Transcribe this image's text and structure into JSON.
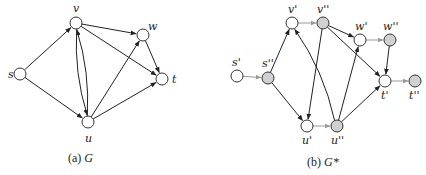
{
  "colors": {
    "edge": "#222222",
    "split_edge": "#999999",
    "node_stroke": "#333333",
    "node_fill_in": "#ffffff",
    "node_fill_out": "#d0d0d0"
  },
  "graph_a": {
    "caption_prefix": "(a) ",
    "caption_symbol": "G",
    "nodes": [
      {
        "id": "s",
        "label": "s",
        "x": 20,
        "y": 74,
        "lx": 8,
        "ly": 78
      },
      {
        "id": "v",
        "label": "v",
        "x": 76,
        "y": 23,
        "lx": 73,
        "ly": 12
      },
      {
        "id": "w",
        "label": "w",
        "x": 143,
        "y": 35,
        "lx": 148,
        "ly": 30
      },
      {
        "id": "t",
        "label": "t",
        "x": 162,
        "y": 79,
        "lx": 172,
        "ly": 83
      },
      {
        "id": "u",
        "label": "u",
        "x": 88,
        "y": 122,
        "lx": 85,
        "ly": 142
      }
    ],
    "edges": [
      [
        "s",
        "v"
      ],
      [
        "s",
        "u"
      ],
      [
        "v",
        "w"
      ],
      [
        "v",
        "t"
      ],
      [
        "v",
        "u"
      ],
      [
        "u",
        "v"
      ],
      [
        "u",
        "w"
      ],
      [
        "u",
        "t"
      ],
      [
        "w",
        "t"
      ]
    ]
  },
  "graph_b": {
    "caption_prefix": "(b) ",
    "caption_symbol": "G*",
    "nodes": [
      {
        "id": "s1",
        "label": "s'",
        "x": 237,
        "y": 76,
        "lx": 232,
        "ly": 66,
        "type": "in"
      },
      {
        "id": "s2",
        "label": "s''",
        "x": 268,
        "y": 78,
        "lx": 262,
        "ly": 67,
        "type": "out"
      },
      {
        "id": "v1",
        "label": "v'",
        "x": 292,
        "y": 23,
        "lx": 288,
        "ly": 13,
        "type": "in"
      },
      {
        "id": "v2",
        "label": "v''",
        "x": 323,
        "y": 23,
        "lx": 317,
        "ly": 13,
        "type": "out"
      },
      {
        "id": "w1",
        "label": "w'",
        "x": 360,
        "y": 40,
        "lx": 355,
        "ly": 30,
        "type": "in"
      },
      {
        "id": "w2",
        "label": "w''",
        "x": 390,
        "y": 40,
        "lx": 383,
        "ly": 30,
        "type": "out"
      },
      {
        "id": "t1",
        "label": "t'",
        "x": 385,
        "y": 81,
        "lx": 381,
        "ly": 99,
        "type": "in"
      },
      {
        "id": "t2",
        "label": "t''",
        "x": 415,
        "y": 81,
        "lx": 409,
        "ly": 99,
        "type": "out"
      },
      {
        "id": "u1",
        "label": "u'",
        "x": 307,
        "y": 126,
        "lx": 302,
        "ly": 144,
        "type": "in"
      },
      {
        "id": "u2",
        "label": "u''",
        "x": 337,
        "y": 126,
        "lx": 331,
        "ly": 144,
        "type": "out"
      }
    ],
    "split_edges": [
      [
        "s1",
        "s2"
      ],
      [
        "v1",
        "v2"
      ],
      [
        "w1",
        "w2"
      ],
      [
        "u1",
        "u2"
      ],
      [
        "t1",
        "t2"
      ]
    ],
    "edges": [
      [
        "s2",
        "v1"
      ],
      [
        "s2",
        "u1"
      ],
      [
        "v2",
        "w1"
      ],
      [
        "v2",
        "t1"
      ],
      [
        "v2",
        "u1"
      ],
      [
        "u2",
        "v1"
      ],
      [
        "u2",
        "w1"
      ],
      [
        "u2",
        "t1"
      ],
      [
        "w2",
        "t1"
      ]
    ]
  }
}
